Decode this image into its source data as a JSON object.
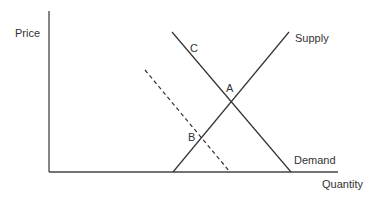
{
  "diagram": {
    "type": "supply-demand",
    "axes": {
      "y_label": "Price",
      "x_label": "Quantity"
    },
    "curves": {
      "supply_label": "Supply",
      "demand_label": "Demand",
      "shifted_demand_style": "dashed"
    },
    "points": {
      "a": "A",
      "b": "B",
      "c": "C"
    },
    "colors": {
      "line": "#333333",
      "text": "#333333",
      "background": "#ffffff"
    }
  }
}
